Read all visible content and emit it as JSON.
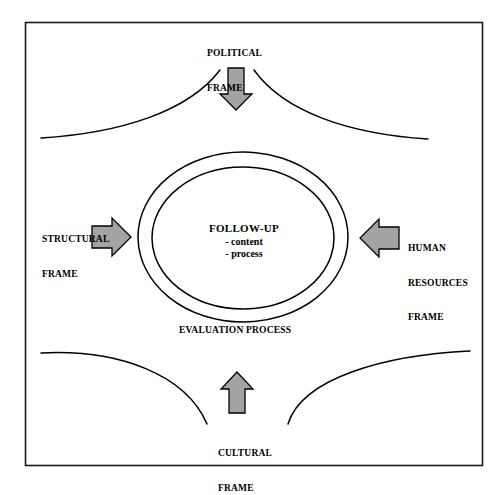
{
  "diagram": {
    "title_center": "FOLLOW-UP",
    "center_bullets": [
      "- content",
      "- process"
    ],
    "process_label": "EVALUATION PROCESS",
    "frames": {
      "political": {
        "line1": "POLITICAL",
        "line2": "FRAME"
      },
      "structural": {
        "line1": "STRUCTURAL",
        "line2": "FRAME"
      },
      "human_resources": {
        "line1": "HUMAN",
        "line2": "RESOURCES",
        "line3": "FRAME"
      },
      "cultural": {
        "line1": "CULTURAL",
        "line2": "FRAME"
      }
    },
    "arrows": [
      {
        "name": "political-arrow",
        "direction": "down"
      },
      {
        "name": "structural-arrow",
        "direction": "right"
      },
      {
        "name": "human-resources-arrow",
        "direction": "left"
      },
      {
        "name": "cultural-arrow",
        "direction": "up"
      }
    ],
    "colors": {
      "arrow_fill": "#a3a3a3",
      "stroke": "#000000",
      "background": "#ffffff",
      "border": "#1a1a1a"
    }
  }
}
